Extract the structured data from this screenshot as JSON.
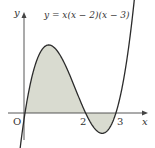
{
  "chart_data": {
    "type": "line",
    "title": "",
    "equation_label": "y = x(x − 2)(x − 3)",
    "function": "x*(x-2)*(x-3)",
    "xlabel": "x",
    "ylabel": "y",
    "origin_label": "O",
    "x_tick_labels": [
      "2",
      "3"
    ],
    "roots": [
      0,
      2,
      3
    ],
    "local_max": {
      "x": 0.785,
      "y": 2.113
    },
    "local_min": {
      "x": 2.549,
      "y": -0.631
    },
    "shaded_regions": [
      {
        "from": 0,
        "to": 2,
        "sign": "positive"
      },
      {
        "from": 2,
        "to": 3,
        "sign": "negative"
      }
    ],
    "grid": false,
    "legend": "none"
  },
  "colors": {
    "curve": "#2b2b2b",
    "axis": "#444444",
    "fill": "#d9dbd0",
    "text": "#333333"
  }
}
